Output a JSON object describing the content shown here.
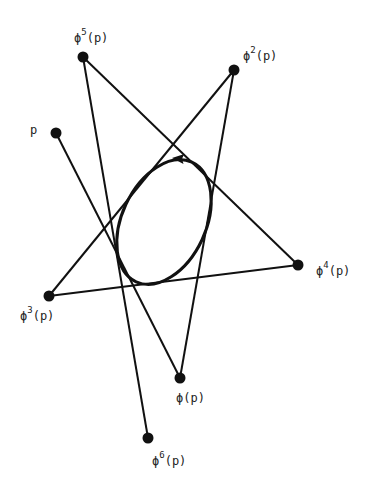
{
  "diagram": {
    "title": "",
    "colors": {
      "stroke": "#111111",
      "background": "#ffffff",
      "text": "#222222"
    },
    "points": [
      {
        "id": "p",
        "x": 56,
        "y": 133,
        "label": "p",
        "sup": "",
        "tail": "",
        "lx": 30,
        "ly": 134
      },
      {
        "id": "phi1",
        "x": 180,
        "y": 378,
        "label": "ϕ",
        "sup": "",
        "tail": "(p)",
        "lx": 176,
        "ly": 402
      },
      {
        "id": "phi2",
        "x": 234,
        "y": 70,
        "label": "ϕ",
        "sup": "2",
        "tail": "(p)",
        "lx": 243,
        "ly": 60
      },
      {
        "id": "phi3",
        "x": 49,
        "y": 296,
        "label": "ϕ",
        "sup": "3",
        "tail": "(p)",
        "lx": 20,
        "ly": 320
      },
      {
        "id": "phi4",
        "x": 298,
        "y": 265,
        "label": "ϕ",
        "sup": "4",
        "tail": "(p)",
        "lx": 316,
        "ly": 275
      },
      {
        "id": "phi5",
        "x": 83,
        "y": 57,
        "label": "ϕ",
        "sup": "5",
        "tail": "(p)",
        "lx": 74,
        "ly": 42
      },
      {
        "id": "phi6",
        "x": 148,
        "y": 438,
        "label": "ϕ",
        "sup": "6",
        "tail": "(p)",
        "lx": 152,
        "ly": 465
      }
    ],
    "segments": [
      [
        "p",
        "phi1"
      ],
      [
        "phi1",
        "phi2"
      ],
      [
        "phi2",
        "phi3"
      ],
      [
        "phi3",
        "phi4"
      ],
      [
        "phi4",
        "phi5"
      ],
      [
        "phi5",
        "phi6"
      ]
    ],
    "ellipse": {
      "cx": 164,
      "cy": 222,
      "rx": 42,
      "ry": 66,
      "rotate": 25,
      "arrow_direction": "counterclockwise"
    }
  }
}
